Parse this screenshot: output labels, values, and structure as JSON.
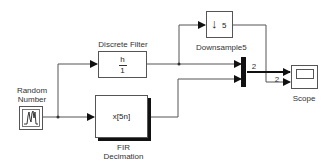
{
  "diagram": {
    "blocks": {
      "random_number": {
        "label_line1": "Random",
        "label_line2": "Number"
      },
      "discrete_filter": {
        "label": "Discrete Filter",
        "numerator": "h",
        "denominator": "1"
      },
      "fir_decimation": {
        "label_line1": "FIR",
        "label_line2": "Decimation",
        "content": "x[5n]"
      },
      "downsample": {
        "label": "Downsample5",
        "factor": "5",
        "arrow": "↓"
      },
      "mux": {
        "output_width": "2"
      },
      "scope": {
        "label": "Scope",
        "input_width": "2"
      }
    },
    "colors": {
      "line": "#555555",
      "block_border": "#555555",
      "mux": "#111111",
      "shadow": "#111111"
    }
  }
}
